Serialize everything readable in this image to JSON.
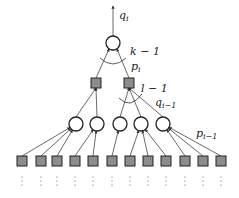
{
  "labels": {
    "top_output": "q",
    "top_output_sub": "i",
    "top_fanin": "k − 1",
    "top_edge": "p",
    "top_edge_sub": "i",
    "mid_fanin": "l − 1",
    "mid_edge": "q",
    "mid_edge_sub": "i−1",
    "bottom_edge": "p",
    "bottom_edge_sub": "i−1"
  },
  "colors": {
    "square_fill": "#8c8c8c",
    "stroke": "#222222",
    "line": "#444444"
  },
  "nodes": {
    "top_circle": {
      "x": 113,
      "y": 43,
      "r": 7
    },
    "mid_squares": [
      {
        "x": 96,
        "y": 83
      },
      {
        "x": 129,
        "y": 83
      }
    ],
    "circles": [
      {
        "x": 76,
        "y": 124
      },
      {
        "x": 97,
        "y": 124
      },
      {
        "x": 120,
        "y": 124
      },
      {
        "x": 141,
        "y": 124
      },
      {
        "x": 163,
        "y": 124
      }
    ],
    "bottom_squares": [
      22,
      41,
      57,
      75,
      93,
      112,
      130,
      148,
      166,
      185,
      203,
      221
    ]
  }
}
